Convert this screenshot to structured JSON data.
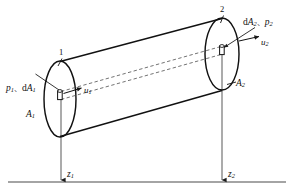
{
  "figure": {
    "type": "engineering-diagram",
    "background_color": "#ffffff",
    "line_color": "#1a1a1a",
    "dash_color": "#555555"
  },
  "labels": {
    "station1_point": "1",
    "station2_point": "2",
    "inlet_pressure_area": {
      "pressure": "p",
      "pressure_sub": "1",
      "separator": "、",
      "area_prefix": "d",
      "area": "A",
      "area_sub": "1"
    },
    "outlet_pressure_area": {
      "area_prefix": "d",
      "area": "A",
      "area_sub": "2",
      "separator": "、",
      "pressure": "p",
      "pressure_sub": "2"
    },
    "inlet_velocity": {
      "symbol": "u",
      "sub": "1"
    },
    "outlet_velocity": {
      "symbol": "u",
      "sub": "2"
    },
    "inlet_section_area": {
      "symbol": "A",
      "sub": "1"
    },
    "outlet_section_area": {
      "symbol": "A",
      "sub": "2"
    },
    "inlet_elevation": {
      "symbol": "z",
      "sub": "1"
    },
    "outlet_elevation": {
      "symbol": "z",
      "sub": "2"
    }
  },
  "geometry": {
    "datum_line": {
      "y": 182,
      "x_start": 8,
      "x_end": 286
    },
    "inlet_ellipse": {
      "cx": 60,
      "cy": 99,
      "rx": 16,
      "ry": 38
    },
    "outlet_ellipse": {
      "cx": 222,
      "cy": 54,
      "rx": 17,
      "ry": 36
    },
    "elevation_line_1_x": 61,
    "elevation_line_2_x": 222
  }
}
